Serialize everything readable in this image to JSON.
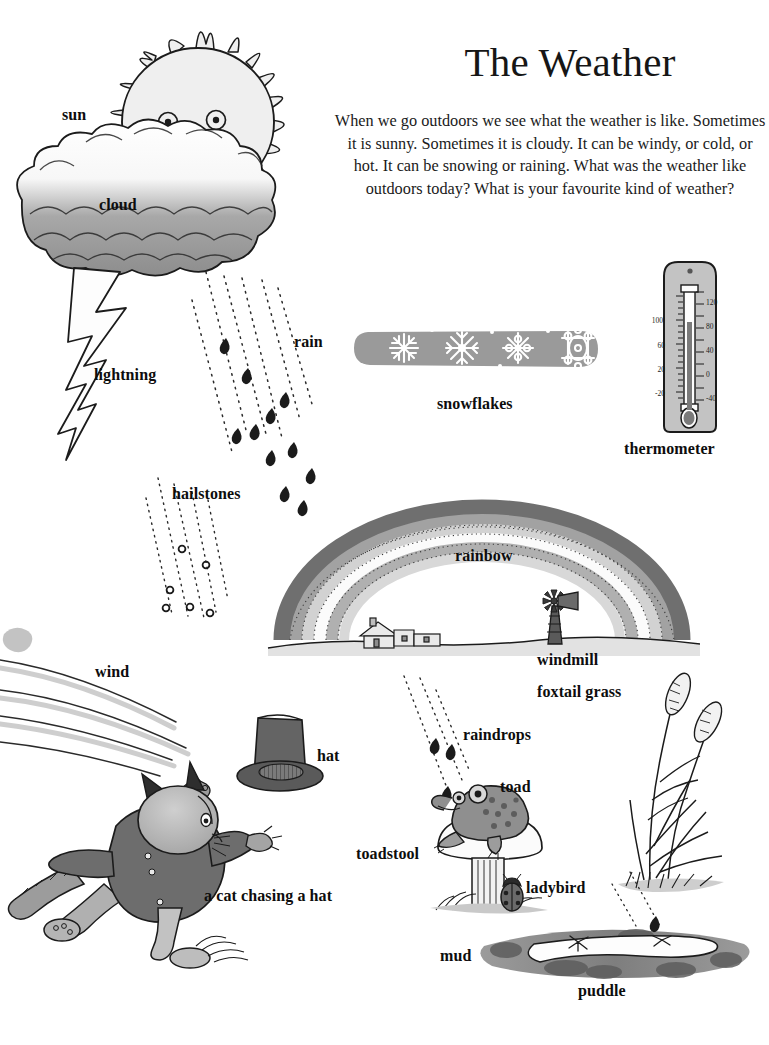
{
  "page": {
    "title": "The Weather",
    "intro": "When we go outdoors we see what the weather is like. Sometimes it is sunny. Sometimes it is cloudy. It can be windy, or cold, or hot. It can be snowing or raining. What was the weather like outdoors today? What is your favourite kind of weather?"
  },
  "labels": {
    "sun": "sun",
    "cloud": "cloud",
    "lightning": "lightning",
    "rain": "rain",
    "hailstones": "hailstones",
    "snowflakes": "snowflakes",
    "thermometer": "thermometer",
    "rainbow": "rainbow",
    "windmill": "windmill",
    "wind": "wind",
    "hat": "hat",
    "cat_chasing_hat": "a cat chasing a hat",
    "raindrops": "raindrops",
    "foxtail_grass": "foxtail grass",
    "toad": "toad",
    "toadstool": "toadstool",
    "ladybird": "ladybird",
    "mud": "mud",
    "puddle": "puddle"
  },
  "thermometer_scale": {
    "left": [
      "100",
      "60",
      "20",
      "-20"
    ],
    "right": [
      "120",
      "80",
      "40",
      "0",
      "-40"
    ]
  },
  "colors": {
    "paper": "#ffffff",
    "ink": "#111111",
    "cloud_dark": "#8d8d8d",
    "cloud_light": "#f4f4f4",
    "sun_fill": "#efefef",
    "rainbow_outer": "#6f6f6f",
    "rainbow_mid": "#9c9c9c",
    "rainbow_light": "#cfcfcf",
    "rainbow_white": "#fbfbfb",
    "snow_band": "#9a9a9a",
    "cat_body": "#6d6d6d",
    "cat_head": "#b4b4b4",
    "hat": "#646464",
    "mud": "#8a8a8a",
    "ground": "#d9d9d9",
    "thermometer_body": "#bdbdbd",
    "mercury": "#7a7a7a"
  }
}
